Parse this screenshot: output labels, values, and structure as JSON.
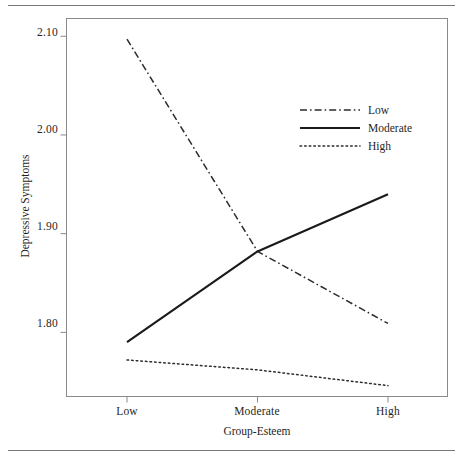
{
  "chart_data": {
    "type": "line",
    "title": "",
    "subtitle": "",
    "xlabel": "Group-Esteem",
    "ylabel": "Depressive Symptoms",
    "categories": [
      "Low",
      "Moderate",
      "High"
    ],
    "x_tick_labels": [
      "Low",
      "Moderate",
      "High"
    ],
    "y_tick_labels": [
      "1.80",
      "1.90",
      "2.00",
      "2.10"
    ],
    "y_tick_values": [
      1.8,
      1.9,
      2.0,
      2.1
    ],
    "ylim": [
      1.735,
      2.118
    ],
    "xlim": [
      0,
      2
    ],
    "grid": false,
    "legend_position": "upper-right-inside",
    "series": [
      {
        "name": "Low",
        "style": "dash-dot",
        "color": "#2b2b2b",
        "values": [
          2.097,
          1.882,
          1.809
        ]
      },
      {
        "name": "Moderate",
        "style": "solid",
        "color": "#1a1a1a",
        "values": [
          1.79,
          1.882,
          1.94
        ]
      },
      {
        "name": "High",
        "style": "dotted",
        "color": "#2b2b2b",
        "values": [
          1.772,
          1.762,
          1.746
        ]
      }
    ],
    "legend_entries": [
      "Low",
      "Moderate",
      "High"
    ],
    "annotations": []
  },
  "figure": {
    "top_rule": "horizontal-rule",
    "bottom_rule": "horizontal-rule"
  },
  "axis": {
    "y_ticks": [
      {
        "label": "2.10",
        "value": 2.1
      },
      {
        "label": "2.00",
        "value": 2.0
      },
      {
        "label": "1.90",
        "value": 1.9
      },
      {
        "label": "1.80",
        "value": 1.8
      }
    ],
    "x_ticks": [
      {
        "label": "Low",
        "value": 0
      },
      {
        "label": "Moderate",
        "value": 1
      },
      {
        "label": "High",
        "value": 2
      }
    ]
  },
  "legend": {
    "items": [
      {
        "label": "Low",
        "style": "dash-dot"
      },
      {
        "label": "Moderate",
        "style": "solid"
      },
      {
        "label": "High",
        "style": "dotted"
      }
    ]
  }
}
